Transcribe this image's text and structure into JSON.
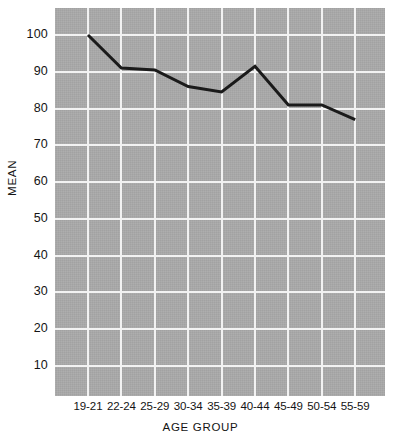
{
  "chart_data": {
    "type": "line",
    "title": "",
    "xlabel": "AGE GROUP",
    "ylabel": "MEAN",
    "categories": [
      "19-21",
      "22-24",
      "25-29",
      "30-34",
      "35-39",
      "40-44",
      "45-49",
      "50-54",
      "55-59"
    ],
    "values": [
      100,
      91,
      90.5,
      86,
      84.5,
      91.5,
      81,
      81,
      77
    ],
    "series": [
      {
        "name": "MEAN",
        "values": [
          100,
          91,
          90.5,
          86,
          84.5,
          91.5,
          81,
          81,
          77
        ]
      }
    ],
    "ylim": [
      0,
      105
    ],
    "ytick_labels": [
      "100",
      "90",
      "80",
      "70",
      "60",
      "50",
      "40",
      "30",
      "20",
      "10"
    ],
    "ytick_values": [
      100,
      90,
      80,
      70,
      60,
      50,
      40,
      30,
      20,
      10
    ],
    "grid": true,
    "grid_color": "#f2f2f2",
    "plot_background": "#a8a8a8",
    "line_color": "#1a1a1a",
    "line_width": 3,
    "legend": "none",
    "markers": "none"
  }
}
